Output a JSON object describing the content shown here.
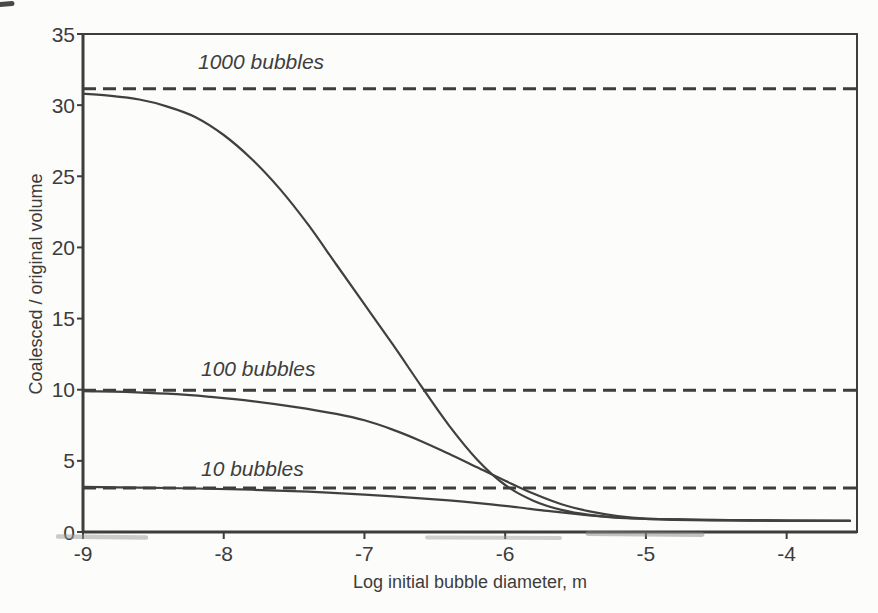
{
  "figure": {
    "xlabel": "Log initial bubble diameter, m",
    "ylabel": "Coalesced / original volume"
  },
  "chart_data": {
    "type": "line",
    "title": "",
    "xlabel": "Log initial bubble diameter, m",
    "ylabel": "Coalesced / original volume",
    "xlim": [
      -9,
      -3.5
    ],
    "ylim": [
      0,
      35
    ],
    "x_ticks": [
      -9,
      -8,
      -7,
      -6,
      -5,
      -4
    ],
    "y_ticks": [
      0,
      5,
      10,
      15,
      20,
      25,
      30,
      35
    ],
    "grid": false,
    "legend_position": "none",
    "line_color": "#404040",
    "dash_color": "#3d3d3d",
    "frame_color": "#3d3d3d",
    "text_color": "#3c3c3c",
    "annotations": [
      {
        "text": "1000 bubbles",
        "x": -8.18,
        "y": 32.45
      },
      {
        "text": "100 bubbles",
        "x": -8.16,
        "y": 10.92
      },
      {
        "text": "10 bubbles",
        "x": -8.16,
        "y": 3.87
      }
    ],
    "dashed_asymptotes": [
      {
        "label": "1000 bubbles",
        "value": 31.15
      },
      {
        "label": "100 bubbles",
        "value": 9.97
      },
      {
        "label": "10 bubbles",
        "value": 3.1
      }
    ],
    "series": [
      {
        "name": "1000 bubbles",
        "points": [
          [
            -9.0,
            30.8
          ],
          [
            -8.8,
            30.65
          ],
          [
            -8.6,
            30.4
          ],
          [
            -8.4,
            29.9
          ],
          [
            -8.2,
            29.15
          ],
          [
            -8.0,
            27.9
          ],
          [
            -7.8,
            26.2
          ],
          [
            -7.6,
            24.1
          ],
          [
            -7.4,
            21.6
          ],
          [
            -7.2,
            18.8
          ],
          [
            -7.0,
            16.0
          ],
          [
            -6.8,
            13.2
          ],
          [
            -6.6,
            10.3
          ],
          [
            -6.4,
            7.5
          ],
          [
            -6.2,
            5.1
          ],
          [
            -6.0,
            3.3
          ],
          [
            -5.8,
            2.2
          ],
          [
            -5.6,
            1.55
          ],
          [
            -5.4,
            1.2
          ],
          [
            -5.2,
            1.02
          ],
          [
            -5.0,
            0.93
          ],
          [
            -4.7,
            0.87
          ],
          [
            -4.4,
            0.83
          ],
          [
            -4.0,
            0.8
          ],
          [
            -3.55,
            0.79
          ]
        ]
      },
      {
        "name": "100 bubbles",
        "points": [
          [
            -9.0,
            9.9
          ],
          [
            -8.7,
            9.85
          ],
          [
            -8.4,
            9.72
          ],
          [
            -8.1,
            9.5
          ],
          [
            -7.8,
            9.2
          ],
          [
            -7.5,
            8.8
          ],
          [
            -7.2,
            8.3
          ],
          [
            -7.0,
            7.85
          ],
          [
            -6.8,
            7.2
          ],
          [
            -6.6,
            6.4
          ],
          [
            -6.4,
            5.5
          ],
          [
            -6.2,
            4.55
          ],
          [
            -6.0,
            3.6
          ],
          [
            -5.8,
            2.7
          ],
          [
            -5.6,
            1.95
          ],
          [
            -5.4,
            1.45
          ],
          [
            -5.2,
            1.12
          ],
          [
            -5.0,
            0.95
          ],
          [
            -4.7,
            0.87
          ],
          [
            -4.4,
            0.83
          ],
          [
            -4.0,
            0.8
          ],
          [
            -3.55,
            0.78
          ]
        ]
      },
      {
        "name": "10 bubbles",
        "points": [
          [
            -9.0,
            3.17
          ],
          [
            -8.6,
            3.12
          ],
          [
            -8.2,
            3.06
          ],
          [
            -7.8,
            2.97
          ],
          [
            -7.4,
            2.83
          ],
          [
            -7.0,
            2.62
          ],
          [
            -6.7,
            2.44
          ],
          [
            -6.4,
            2.22
          ],
          [
            -6.1,
            1.95
          ],
          [
            -5.9,
            1.72
          ],
          [
            -5.7,
            1.48
          ],
          [
            -5.5,
            1.27
          ],
          [
            -5.3,
            1.08
          ],
          [
            -5.1,
            0.95
          ],
          [
            -4.8,
            0.86
          ],
          [
            -4.4,
            0.81
          ],
          [
            -4.0,
            0.79
          ],
          [
            -3.55,
            0.78
          ]
        ]
      }
    ]
  }
}
